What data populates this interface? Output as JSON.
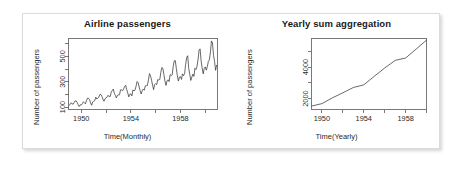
{
  "figure": {
    "panel_background": "#ffffff",
    "frame_color": "#dcdcdc",
    "axis_color": "#555555",
    "line_color": "#333333"
  },
  "charts": [
    {
      "id": "airline-passengers",
      "title": "Airline passengers",
      "ylabel": "Number of passengers",
      "xlabel": "Time(Monthly)"
    },
    {
      "id": "yearly-sum-aggregation",
      "title": "Yearly sum aggregation",
      "ylabel": "Number of passengers",
      "xlabel": "Time(Yearly)"
    }
  ],
  "chart_data": [
    {
      "type": "line",
      "id": "airline-passengers",
      "title": "Airline passengers",
      "xlabel": "Time(Monthly)",
      "ylabel": "Number of passengers",
      "xlim": [
        1949.0,
        1961.0
      ],
      "ylim": [
        80,
        640
      ],
      "xticks": [
        1950,
        1952,
        1954,
        1956,
        1958,
        1960
      ],
      "xtick_labels": [
        "1950",
        "",
        "1954",
        "",
        "1958",
        ""
      ],
      "yticks": [
        100,
        200,
        300,
        400,
        500,
        600
      ],
      "ytick_labels": [
        "100",
        "",
        "300",
        "",
        "500",
        ""
      ],
      "grid": false,
      "legend": "none",
      "x": [
        1949.0,
        1949.083,
        1949.167,
        1949.25,
        1949.333,
        1949.417,
        1949.5,
        1949.583,
        1949.667,
        1949.75,
        1949.833,
        1949.917,
        1950.0,
        1950.083,
        1950.167,
        1950.25,
        1950.333,
        1950.417,
        1950.5,
        1950.583,
        1950.667,
        1950.75,
        1950.833,
        1950.917,
        1951.0,
        1951.083,
        1951.167,
        1951.25,
        1951.333,
        1951.417,
        1951.5,
        1951.583,
        1951.667,
        1951.75,
        1951.833,
        1951.917,
        1952.0,
        1952.083,
        1952.167,
        1952.25,
        1952.333,
        1952.417,
        1952.5,
        1952.583,
        1952.667,
        1952.75,
        1952.833,
        1952.917,
        1953.0,
        1953.083,
        1953.167,
        1953.25,
        1953.333,
        1953.417,
        1953.5,
        1953.583,
        1953.667,
        1953.75,
        1953.833,
        1953.917,
        1954.0,
        1954.083,
        1954.167,
        1954.25,
        1954.333,
        1954.417,
        1954.5,
        1954.583,
        1954.667,
        1954.75,
        1954.833,
        1954.917,
        1955.0,
        1955.083,
        1955.167,
        1955.25,
        1955.333,
        1955.417,
        1955.5,
        1955.583,
        1955.667,
        1955.75,
        1955.833,
        1955.917,
        1956.0,
        1956.083,
        1956.167,
        1956.25,
        1956.333,
        1956.417,
        1956.5,
        1956.583,
        1956.667,
        1956.75,
        1956.833,
        1956.917,
        1957.0,
        1957.083,
        1957.167,
        1957.25,
        1957.333,
        1957.417,
        1957.5,
        1957.583,
        1957.667,
        1957.75,
        1957.833,
        1957.917,
        1958.0,
        1958.083,
        1958.167,
        1958.25,
        1958.333,
        1958.417,
        1958.5,
        1958.583,
        1958.667,
        1958.75,
        1958.833,
        1958.917,
        1959.0,
        1959.083,
        1959.167,
        1959.25,
        1959.333,
        1959.417,
        1959.5,
        1959.583,
        1959.667,
        1959.75,
        1959.833,
        1959.917,
        1960.0,
        1960.083,
        1960.167,
        1960.25,
        1960.333,
        1960.417,
        1960.5,
        1960.583,
        1960.667,
        1960.75,
        1960.833,
        1960.917
      ],
      "values": [
        112,
        118,
        132,
        129,
        121,
        135,
        148,
        148,
        136,
        119,
        104,
        118,
        115,
        126,
        141,
        135,
        125,
        149,
        170,
        170,
        158,
        133,
        114,
        140,
        145,
        150,
        178,
        163,
        172,
        178,
        199,
        199,
        184,
        162,
        146,
        166,
        171,
        180,
        193,
        181,
        183,
        218,
        230,
        242,
        209,
        191,
        172,
        194,
        196,
        196,
        236,
        235,
        229,
        243,
        264,
        272,
        237,
        211,
        180,
        201,
        204,
        188,
        235,
        227,
        234,
        264,
        302,
        293,
        259,
        229,
        203,
        229,
        242,
        233,
        267,
        269,
        270,
        315,
        364,
        347,
        312,
        274,
        237,
        278,
        284,
        277,
        317,
        313,
        318,
        374,
        413,
        405,
        355,
        306,
        271,
        306,
        315,
        301,
        356,
        348,
        355,
        422,
        465,
        467,
        404,
        347,
        305,
        336,
        340,
        318,
        362,
        348,
        363,
        435,
        491,
        505,
        404,
        359,
        310,
        337,
        360,
        342,
        406,
        396,
        420,
        472,
        548,
        559,
        463,
        407,
        362,
        405,
        417,
        391,
        419,
        461,
        472,
        535,
        622,
        606,
        508,
        461,
        390,
        432
      ]
    },
    {
      "type": "line",
      "id": "yearly-sum-aggregation",
      "title": "Yearly sum aggregation",
      "xlabel": "Time(Yearly)",
      "ylabel": "Number of passengers",
      "xlim": [
        1949.0,
        1960.0
      ],
      "ylim": [
        1300,
        5800
      ],
      "xticks": [
        1950,
        1952,
        1954,
        1956,
        1958,
        1960
      ],
      "xtick_labels": [
        "1950",
        "",
        "1954",
        "",
        "1958",
        ""
      ],
      "yticks": [
        2000,
        3000,
        4000,
        5000
      ],
      "ytick_labels": [
        "2000",
        "",
        "4000",
        ""
      ],
      "grid": false,
      "legend": "none",
      "categories": [
        1949,
        1950,
        1951,
        1952,
        1953,
        1954,
        1955,
        1956,
        1957,
        1958,
        1959,
        1960
      ],
      "values": [
        1520,
        1676,
        2042,
        2364,
        2700,
        2867,
        3408,
        3939,
        4421,
        4572,
        5140,
        5714
      ]
    }
  ]
}
